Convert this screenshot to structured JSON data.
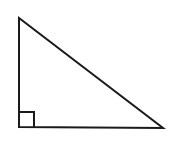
{
  "figure": {
    "name": "right-triangle",
    "background_color": "#ffffff",
    "stroke_color": "#1a1a1a",
    "stroke_width": 2,
    "canvas": {
      "width": 171,
      "height": 149
    }
  },
  "chart_data": {
    "type": "diagram",
    "title": "",
    "shape": "right triangle",
    "vertices": [
      {
        "label": "apex",
        "x": 19,
        "y": 18
      },
      {
        "label": "right-angle-vertex",
        "x": 19,
        "y": 127
      },
      {
        "label": "base-right-vertex",
        "x": 163,
        "y": 128
      }
    ],
    "edges": [
      {
        "name": "vertical-leg",
        "from": "apex",
        "to": "right-angle-vertex",
        "length_px": 109
      },
      {
        "name": "horizontal-leg",
        "from": "right-angle-vertex",
        "to": "base-right-vertex",
        "length_px": 144
      },
      {
        "name": "hypotenuse",
        "from": "apex",
        "to": "base-right-vertex",
        "length_px": 181
      }
    ],
    "right_angle_marker": {
      "at_vertex": "right-angle-vertex",
      "size_px": 15,
      "x": 19,
      "y": 112
    },
    "annotations": [],
    "legend": [],
    "grid": false
  }
}
